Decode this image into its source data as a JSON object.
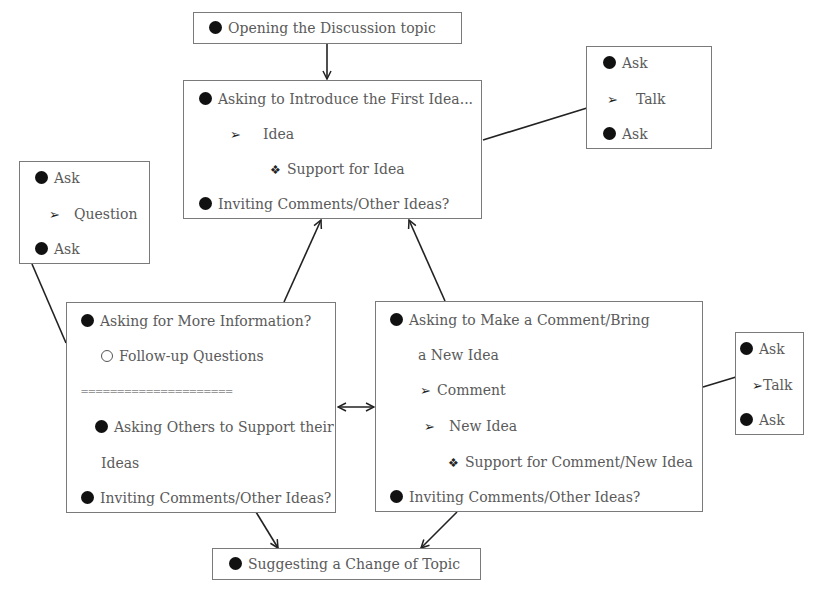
{
  "diagram": {
    "opening": {
      "text": "Opening the Discussion topic"
    },
    "first_idea": {
      "title": "Asking to Introduce the First Idea...",
      "idea": "Idea",
      "support": "Support for Idea",
      "inviting": "Inviting Comments/Other Ideas?"
    },
    "side_top_right": {
      "ask1": "Ask",
      "talk": "Talk",
      "ask2": "Ask"
    },
    "side_left": {
      "ask1": "Ask",
      "question": "Question",
      "ask2": "Ask"
    },
    "more_info": {
      "title": "Asking for More Information?",
      "followup": "Follow-up Questions",
      "separator": "=====================",
      "support_others_1": "Asking Others to Support their",
      "support_others_2": "Ideas",
      "inviting": "Inviting Comments/Other Ideas?"
    },
    "comment": {
      "title_1": "Asking to Make a Comment/Bring",
      "title_2": "a New Idea",
      "comment": "Comment",
      "new_idea": "New Idea",
      "support": "Support for Comment/New Idea",
      "inviting": "Inviting Comments/Other Ideas?"
    },
    "side_right": {
      "ask1": "Ask",
      "talk": "Talk",
      "ask2": "Ask"
    },
    "change_topic": {
      "text": "Suggesting a Change of Topic"
    }
  },
  "icons": {
    "bullet": "filled-circle",
    "sub_bullet": "arrowhead",
    "sub_sub_bullet": "four-diamond",
    "hollow_bullet": "hollow-circle"
  },
  "colors": {
    "border": "#7a7a7a",
    "text": "#5a5a5a",
    "line": "#222222"
  }
}
